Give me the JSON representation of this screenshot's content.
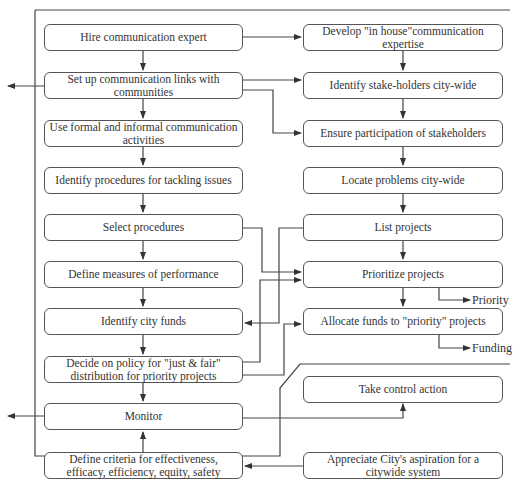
{
  "diagram": {
    "type": "flowchart",
    "left_column": [
      {
        "id": "L1",
        "text": "Hire communication expert"
      },
      {
        "id": "L2",
        "text": "Set up communication links with communities"
      },
      {
        "id": "L3",
        "text": "Use formal and informal communication activities"
      },
      {
        "id": "L4",
        "text": "Identify procedures for tackling issues"
      },
      {
        "id": "L5",
        "text": "Select procedures"
      },
      {
        "id": "L6",
        "text": "Define measures of performance"
      },
      {
        "id": "L7",
        "text": "Identify city funds"
      },
      {
        "id": "L8",
        "text": "Decide on policy for \"just & fair\" distribution for priority projects"
      },
      {
        "id": "L9",
        "text": "Monitor"
      },
      {
        "id": "L10",
        "text": "Define criteria for effectiveness, efficacy, efficiency, equity, safety"
      }
    ],
    "right_column": [
      {
        "id": "R1",
        "text": "Develop \"in house\"communication expertise"
      },
      {
        "id": "R2",
        "text": "Identify stake-holders city-wide"
      },
      {
        "id": "R3",
        "text": "Ensure participation of stakeholders"
      },
      {
        "id": "R4",
        "text": "Locate problems city-wide"
      },
      {
        "id": "R5",
        "text": "List projects"
      },
      {
        "id": "R6",
        "text": "Prioritize projects"
      },
      {
        "id": "R7",
        "text": "Allocate funds to \"priority\" projects"
      },
      {
        "id": "R8",
        "text": "Take control action"
      },
      {
        "id": "R9",
        "text": "Appreciate City's aspiration for a citywide system"
      }
    ],
    "outputs": {
      "priority": "Priority",
      "funding": "Funding"
    },
    "edges": [
      [
        "L1",
        "L2"
      ],
      [
        "L2",
        "L3"
      ],
      [
        "L3",
        "L4"
      ],
      [
        "L4",
        "L5"
      ],
      [
        "L5",
        "L6"
      ],
      [
        "L6",
        "L7"
      ],
      [
        "L7",
        "L8"
      ],
      [
        "L8",
        "L9"
      ],
      [
        "L10",
        "L9"
      ],
      [
        "R1",
        "R2"
      ],
      [
        "R2",
        "R3"
      ],
      [
        "R3",
        "R4"
      ],
      [
        "R4",
        "R5"
      ],
      [
        "R5",
        "R6"
      ],
      [
        "R6",
        "R7"
      ],
      [
        "L1",
        "R1"
      ],
      [
        "L2",
        "R2"
      ],
      [
        "L2",
        "R3"
      ],
      [
        "L5",
        "R6"
      ],
      [
        "L8",
        "R6"
      ],
      [
        "R5",
        "L7"
      ],
      [
        "L8",
        "R7"
      ],
      [
        "L9",
        "R8"
      ],
      [
        "R9",
        "L10"
      ],
      [
        "R6",
        "Priority"
      ],
      [
        "R7",
        "Funding"
      ],
      [
        "L2",
        "out-left"
      ],
      [
        "L9",
        "out-left"
      ]
    ]
  }
}
